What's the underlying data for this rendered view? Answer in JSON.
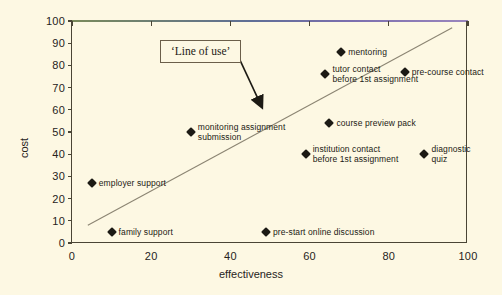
{
  "chart_data": {
    "type": "scatter",
    "title": "",
    "xlabel": "effectiveness",
    "ylabel": "cost",
    "xlim": [
      0,
      100
    ],
    "ylim": [
      0,
      100
    ],
    "xticks": [
      "0",
      "20",
      "40",
      "60",
      "80",
      "100"
    ],
    "yticks": [
      "0",
      "10",
      "20",
      "30",
      "40",
      "50",
      "60",
      "70",
      "80",
      "90",
      "100"
    ],
    "grid": false,
    "legend": "none",
    "points": [
      {
        "label": "employer support",
        "x": 5,
        "y": 27,
        "label_pos": "right"
      },
      {
        "label": "family support",
        "x": 10,
        "y": 5,
        "label_pos": "right"
      },
      {
        "label": "monitoring assignment\nsubmission",
        "x": 30,
        "y": 50,
        "label_pos": "right"
      },
      {
        "label": "pre-start online discussion",
        "x": 49,
        "y": 5,
        "label_pos": "right"
      },
      {
        "label": "institution contact\nbefore 1st assignment",
        "x": 59,
        "y": 40,
        "label_pos": "right"
      },
      {
        "label": "tutor contact\nbefore 1st assignment",
        "x": 64,
        "y": 76,
        "label_pos": "right"
      },
      {
        "label": "course preview pack",
        "x": 65,
        "y": 54,
        "label_pos": "right"
      },
      {
        "label": "mentoring",
        "x": 68,
        "y": 86,
        "label_pos": "right"
      },
      {
        "label": "pre-course contact",
        "x": 84,
        "y": 77,
        "label_pos": "right"
      },
      {
        "label": "diagnostic\nquiz",
        "x": 89,
        "y": 40,
        "label_pos": "right"
      }
    ],
    "trendline": {
      "x1": 4,
      "y1": 8,
      "x2": 96,
      "y2": 97,
      "color": "#8c8573"
    },
    "annotation": {
      "text": "‘Line of use’",
      "arrow_from_x": 42,
      "arrow_from_y": 85,
      "arrow_to_x": 48,
      "arrow_to_y": 62
    }
  },
  "colors": {
    "background": "#fdf8e3",
    "axis": "#4a4535",
    "marker": "#1c1a14",
    "trend": "#8c8573",
    "callout_border": "#6b5f4a"
  }
}
